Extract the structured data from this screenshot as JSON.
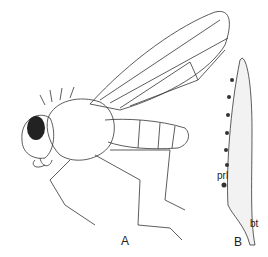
{
  "figure": {
    "panel_a": {
      "label": "A",
      "subject": "adult fly, lateral view"
    },
    "panel_b": {
      "label": "B",
      "subject": "larva, lateral view",
      "annotations": [
        {
          "text": "prl"
        },
        {
          "text": "bt"
        }
      ]
    }
  }
}
